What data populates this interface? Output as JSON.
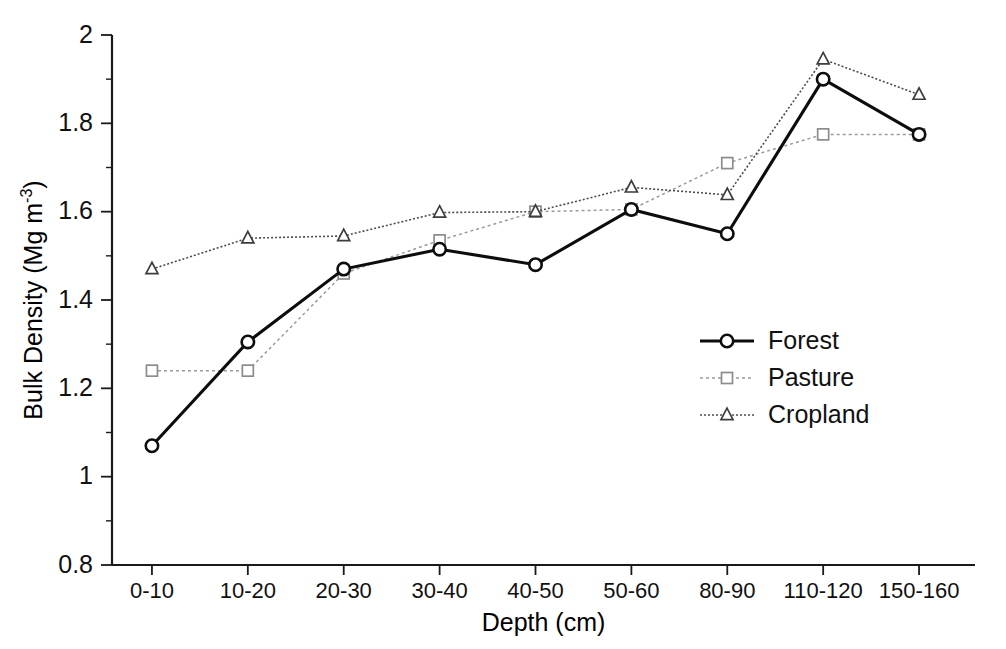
{
  "chart_data": {
    "type": "line",
    "title": "",
    "xlabel": "Depth (cm)",
    "ylabel": "Bulk Density (Mg m-3)",
    "ylabel_base": "Bulk Density (Mg m",
    "ylabel_sup": "-3",
    "ylabel_tail": ")",
    "categories": [
      "0-10",
      "10-20",
      "20-30",
      "30-40",
      "40-50",
      "50-60",
      "80-90",
      "110-120",
      "150-160"
    ],
    "ylim": [
      0.8,
      2.0
    ],
    "yticks": [
      "0.8",
      "1",
      "1.2",
      "1.4",
      "1.6",
      "1.8",
      "2"
    ],
    "ytick_values": [
      0.8,
      1.0,
      1.2,
      1.4,
      1.6,
      1.8,
      2.0
    ],
    "yminor_values": [
      0.9,
      1.1,
      1.3,
      1.5,
      1.7,
      1.9
    ],
    "grid": false,
    "legend_position": "center-right",
    "series": [
      {
        "name": "Forest",
        "marker": "circle",
        "color": "#0d0d0d",
        "linestyle": "solid",
        "values": [
          1.07,
          1.305,
          1.47,
          1.515,
          1.48,
          1.605,
          1.55,
          1.9,
          1.775
        ]
      },
      {
        "name": "Pasture",
        "marker": "square",
        "color": "#8c8c8c",
        "linestyle": "dashed",
        "values": [
          1.24,
          1.24,
          1.46,
          1.535,
          1.6,
          1.605,
          1.71,
          1.775,
          1.775
        ]
      },
      {
        "name": "Cropland",
        "marker": "triangle",
        "color": "#3d3d3d",
        "linestyle": "dotted",
        "values": [
          1.47,
          1.54,
          1.545,
          1.598,
          1.6,
          1.655,
          1.638,
          1.945,
          1.865
        ]
      }
    ]
  }
}
